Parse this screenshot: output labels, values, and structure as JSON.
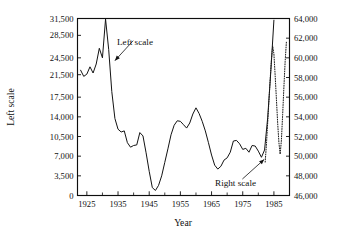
{
  "chart_data": {
    "type": "line",
    "title": "",
    "xlabel": "Year",
    "ylabel": "Left scale",
    "grid": false,
    "legend_position": "inline-annotations",
    "xlim": [
      1922,
      1990
    ],
    "x_ticks": [
      1925,
      1935,
      1945,
      1955,
      1965,
      1975,
      1985
    ],
    "x_minor_step": 5,
    "left_axis": {
      "label": "Left scale",
      "ylim": [
        0,
        31500
      ],
      "ticks": [
        0,
        3500,
        7000,
        10500,
        14000,
        17500,
        21500,
        24500,
        28500,
        31500
      ],
      "tick_labels": [
        "0",
        "3,500",
        "7,000",
        "10,500",
        "14,000",
        "17,500",
        "21,500",
        "24,500",
        "28,500",
        "31,500"
      ]
    },
    "right_axis": {
      "label": "Right scale",
      "ylim": [
        46000,
        64000
      ],
      "ticks": [
        46000,
        48000,
        50000,
        52000,
        54000,
        56000,
        58000,
        60000,
        62000,
        64000
      ],
      "tick_labels": [
        "46,000",
        "48,000",
        "50,000",
        "52,000",
        "54,000",
        "56,000",
        "58,000",
        "60,000",
        "62,000",
        "64,000"
      ]
    },
    "annotations": [
      {
        "text": "Left scale",
        "x": 1940.5,
        "y": 28000,
        "points_to_x": 1934.0,
        "points_to_y": 24000
      },
      {
        "text": "Right scale",
        "x": 1972.0,
        "y": 3200,
        "points_to_x": 1982.2,
        "points_to_y": 6600
      }
    ],
    "series": [
      {
        "name": "Left scale",
        "axis": "left",
        "style": "solid",
        "x": [
          1923.0,
          1924.0,
          1925.0,
          1926.0,
          1927.0,
          1928.0,
          1929.0,
          1930.0,
          1931.0,
          1932.0,
          1933.0,
          1934.0,
          1935.0,
          1936.0,
          1937.0,
          1938.0,
          1939.0,
          1940.0,
          1941.0,
          1942.0,
          1943.0,
          1944.0,
          1945.0,
          1946.0,
          1947.0,
          1948.0,
          1949.0,
          1950.0,
          1951.0,
          1952.0,
          1953.0,
          1954.0,
          1955.0,
          1956.0,
          1957.0,
          1958.0,
          1959.0,
          1960.0,
          1961.0,
          1962.0,
          1963.0,
          1964.0,
          1965.0,
          1966.0,
          1967.0,
          1968.0,
          1969.0,
          1970.0,
          1971.0,
          1972.0,
          1973.0,
          1974.0,
          1975.0,
          1976.0,
          1977.0,
          1978.0,
          1979.0,
          1980.0,
          1981.0,
          1982.0,
          1983.0,
          1984.0,
          1985.0
        ],
        "values": [
          22300,
          21200,
          21600,
          22900,
          21800,
          23400,
          26200,
          24500,
          31400,
          26000,
          18500,
          13700,
          11800,
          11300,
          11500,
          9400,
          8600,
          8900,
          9000,
          11200,
          10600,
          7600,
          4300,
          1400,
          900,
          1800,
          3500,
          5900,
          8300,
          10800,
          12500,
          13300,
          13200,
          12600,
          12000,
          12900,
          14500,
          15600,
          14600,
          13200,
          11500,
          9400,
          7200,
          5400,
          4700,
          5200,
          6300,
          6700,
          7700,
          9700,
          9800,
          9200,
          8200,
          8400,
          7700,
          8900,
          8800,
          7900,
          6800,
          8100,
          13800,
          22000,
          31200
        ]
      },
      {
        "name": "Right scale",
        "axis": "right",
        "style": "dotted",
        "x": [
          1982.2,
          1982.6,
          1983.0,
          1983.4,
          1983.8,
          1984.2,
          1984.6,
          1985.0,
          1985.4,
          1985.8,
          1986.2,
          1986.6,
          1987.0,
          1987.4,
          1987.8,
          1988.2,
          1988.6,
          1989.0
        ],
        "values": [
          49400,
          51200,
          53400,
          55600,
          57800,
          59800,
          61200,
          60400,
          58200,
          55800,
          53400,
          51400,
          50200,
          51600,
          54200,
          57000,
          59600,
          61600
        ]
      }
    ]
  },
  "axis_titles": {
    "x": "Year",
    "y_left": "Left scale"
  }
}
